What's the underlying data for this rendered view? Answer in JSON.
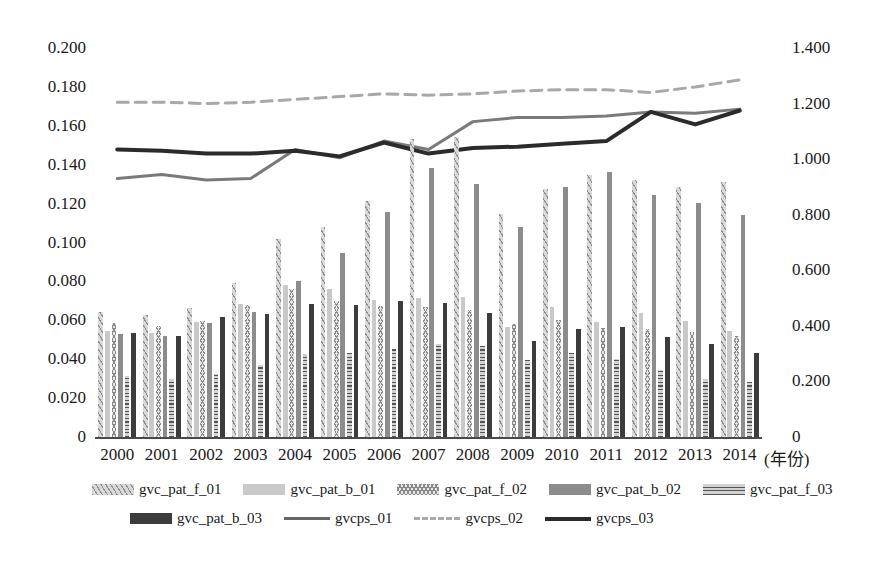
{
  "chart_data": {
    "type": "bar",
    "title": "",
    "xlabel": "(年份)",
    "ylabel": "",
    "grid": false,
    "legend_position": "bottom",
    "categories": [
      "2000",
      "2001",
      "2002",
      "2003",
      "2004",
      "2005",
      "2006",
      "2007",
      "2008",
      "2009",
      "2010",
      "2011",
      "2012",
      "2013",
      "2014"
    ],
    "y_left": {
      "ticks": [
        "0",
        "0.020",
        "0.040",
        "0.060",
        "0.080",
        "0.100",
        "0.120",
        "0.140",
        "0.160",
        "0.180",
        "0.200"
      ],
      "min": 0,
      "max": 0.2,
      "step": 0.02
    },
    "y_right": {
      "ticks": [
        "0",
        "0.200",
        "0.400",
        "0.600",
        "0.800",
        "1.000",
        "1.200",
        "1.400"
      ],
      "min": 0,
      "max": 1.4,
      "step": 0.2
    },
    "bar_series": [
      {
        "name": "gvc_pat_f_01",
        "axis": "left",
        "pattern": "diagonal-hatch",
        "color": "#d9d9d9",
        "values": [
          0.0645,
          0.0625,
          0.0665,
          0.079,
          0.102,
          0.108,
          0.1215,
          0.153,
          0.1545,
          0.1145,
          0.1275,
          0.1345,
          0.132,
          0.1285,
          0.131
        ]
      },
      {
        "name": "gvc_pat_b_01",
        "axis": "left",
        "pattern": "solid-light",
        "color": "#c9c9c9",
        "values": [
          0.0545,
          0.0535,
          0.059,
          0.0685,
          0.078,
          0.076,
          0.0705,
          0.0715,
          0.072,
          0.0565,
          0.067,
          0.059,
          0.064,
          0.0595,
          0.0545
        ]
      },
      {
        "name": "gvc_pat_f_02",
        "axis": "left",
        "pattern": "zigzag-cross",
        "color": "#e8e8e8",
        "values": [
          0.0585,
          0.057,
          0.0595,
          0.068,
          0.076,
          0.07,
          0.0675,
          0.067,
          0.0655,
          0.058,
          0.06,
          0.056,
          0.0555,
          0.054,
          0.052
        ]
      },
      {
        "name": "gvc_pat_b_02",
        "axis": "left",
        "pattern": "solid-mid",
        "color": "#8c8c8c",
        "values": [
          0.053,
          0.052,
          0.0585,
          0.0645,
          0.08,
          0.0945,
          0.1155,
          0.1385,
          0.13,
          0.108,
          0.1285,
          0.136,
          0.1245,
          0.1205,
          0.114
        ]
      },
      {
        "name": "gvc_pat_f_03",
        "axis": "left",
        "pattern": "horizontal-ladder",
        "color": "#d2d2d2",
        "values": [
          0.0315,
          0.03,
          0.0325,
          0.037,
          0.0425,
          0.043,
          0.0455,
          0.048,
          0.047,
          0.0395,
          0.043,
          0.04,
          0.0345,
          0.03,
          0.0285
        ]
      },
      {
        "name": "gvc_pat_b_03",
        "axis": "left",
        "pattern": "solid-dark",
        "color": "#3c3c3c",
        "values": [
          0.0535,
          0.052,
          0.0615,
          0.0635,
          0.0685,
          0.068,
          0.07,
          0.069,
          0.064,
          0.0495,
          0.0555,
          0.0565,
          0.0515,
          0.048,
          0.043
        ]
      }
    ],
    "line_series": [
      {
        "name": "gvcps_01",
        "axis": "right",
        "style": "solid",
        "color": "#7a7a7a",
        "width": 3,
        "values": [
          0.93,
          0.945,
          0.925,
          0.93,
          1.035,
          1.005,
          1.065,
          1.035,
          1.135,
          1.15,
          1.15,
          1.155,
          1.17,
          1.165,
          1.18
        ]
      },
      {
        "name": "gvcps_02",
        "axis": "right",
        "style": "dashed",
        "color": "#a8a8a8",
        "width": 3,
        "values": [
          1.205,
          1.205,
          1.2,
          1.205,
          1.215,
          1.225,
          1.235,
          1.23,
          1.235,
          1.245,
          1.25,
          1.25,
          1.24,
          1.26,
          1.285
        ]
      },
      {
        "name": "gvcps_03",
        "axis": "right",
        "style": "solid",
        "color": "#2b2b2b",
        "width": 4,
        "values": [
          1.035,
          1.03,
          1.02,
          1.02,
          1.03,
          1.01,
          1.06,
          1.02,
          1.04,
          1.045,
          1.055,
          1.065,
          1.17,
          1.125,
          1.175
        ]
      }
    ]
  },
  "legend": {
    "rows": [
      [
        {
          "label": "gvc_pat_f_01",
          "swatch": "pattern",
          "cls": "p-f01"
        },
        {
          "label": "gvc_pat_b_01",
          "swatch": "pattern",
          "cls": "p-b01"
        },
        {
          "label": "gvc_pat_f_02",
          "swatch": "pattern",
          "cls": "p-f02"
        },
        {
          "label": "gvc_pat_b_02",
          "swatch": "pattern",
          "cls": "p-b02"
        },
        {
          "label": "gvc_pat_f_03",
          "swatch": "pattern",
          "cls": "p-f03"
        }
      ],
      [
        {
          "label": "gvc_pat_b_03",
          "swatch": "pattern",
          "cls": "p-b03"
        },
        {
          "label": "gvcps_01",
          "swatch": "line",
          "cls": ""
        },
        {
          "label": "gvcps_02",
          "swatch": "line",
          "cls": "dash"
        },
        {
          "label": "gvcps_03",
          "swatch": "line",
          "cls": "thick"
        }
      ]
    ]
  }
}
